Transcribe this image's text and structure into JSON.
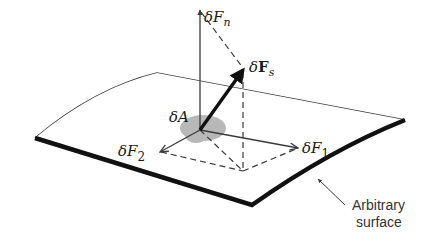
{
  "figure": {
    "type": "force-decomposition-diagram",
    "colors": {
      "line": "#3a3a3a",
      "thick_edge": "#111111",
      "area_patch": "#b8b8b8",
      "background": "#ffffff"
    },
    "labels": {
      "normal_force": {
        "prefix": "δ",
        "main": "F",
        "subscript": "n"
      },
      "shear_force": {
        "prefix": "δ",
        "main": "F",
        "subscript": "s"
      },
      "area": {
        "prefix": "δ",
        "main": "A"
      },
      "force_1": {
        "prefix": "δ",
        "main": "F",
        "subscript": "1"
      },
      "force_2": {
        "prefix": "δ",
        "main": "F",
        "subscript": "2"
      },
      "surface_line1": "Arbitrary",
      "surface_line2": "surface"
    }
  }
}
